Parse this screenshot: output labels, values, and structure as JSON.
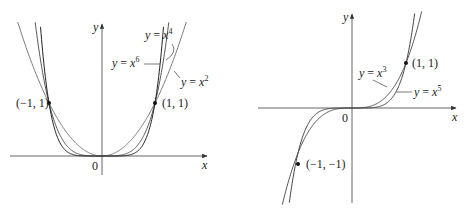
{
  "chart_data": [
    {
      "type": "line",
      "title": "",
      "xlabel": "x",
      "ylabel": "y",
      "origin_label": "0",
      "grid": false,
      "xlim": [
        -1.85,
        1.9
      ],
      "ylim": [
        -0.9,
        2.5
      ],
      "series": [
        {
          "name": "y = x^2",
          "label_text": "y = x",
          "exponent": "2",
          "power": 2
        },
        {
          "name": "y = x^4",
          "label_text": "y = x",
          "exponent": "4",
          "power": 4
        },
        {
          "name": "y = x^6",
          "label_text": "y = x",
          "exponent": "6",
          "power": 6
        }
      ],
      "points": [
        {
          "label": "(−1, 1)",
          "x": -1,
          "y": 1
        },
        {
          "label": "(1, 1)",
          "x": 1,
          "y": 1
        }
      ]
    },
    {
      "type": "line",
      "title": "",
      "xlabel": "x",
      "ylabel": "y",
      "origin_label": "0",
      "grid": false,
      "xlim": [
        -1.75,
        1.9
      ],
      "ylim": [
        -2.1,
        2.1
      ],
      "series": [
        {
          "name": "y = x^3",
          "label_text": "y = x",
          "exponent": "3",
          "power": 3
        },
        {
          "name": "y = x^5",
          "label_text": "y = x",
          "exponent": "5",
          "power": 5
        }
      ],
      "points": [
        {
          "label": "(1, 1)",
          "x": 1,
          "y": 1
        },
        {
          "label": "(−1, −1)",
          "x": -1,
          "y": -1
        }
      ]
    }
  ]
}
